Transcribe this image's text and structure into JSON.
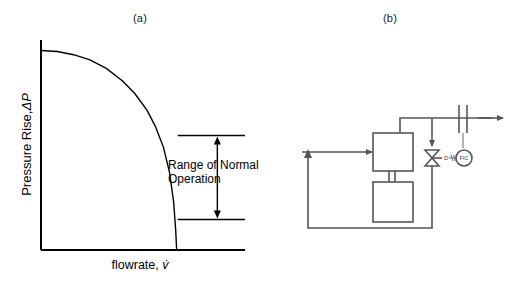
{
  "figure": {
    "panels": [
      {
        "id": "a",
        "label": "(a)"
      },
      {
        "id": "b",
        "label": "(b)"
      }
    ]
  },
  "chart_data": {
    "type": "line",
    "title": "(a)",
    "ylabel_prefix": "Pressure Rise,",
    "ylabel_symbol": "ΔP",
    "xlabel_prefix": "flowrate,",
    "xlabel_symbol": "v̇",
    "grid": false,
    "legend": false,
    "axis_ticks": false,
    "xlim": [
      0,
      1
    ],
    "ylim": [
      0,
      1
    ],
    "series": [
      {
        "name": "pump characteristic curve",
        "x": [
          0.0,
          0.08,
          0.16,
          0.24,
          0.32,
          0.4,
          0.46,
          0.52,
          0.56,
          0.6,
          0.63,
          0.65,
          0.66,
          0.665
        ],
        "y": [
          0.95,
          0.945,
          0.93,
          0.905,
          0.865,
          0.805,
          0.745,
          0.665,
          0.59,
          0.49,
          0.37,
          0.23,
          0.1,
          0.0
        ]
      }
    ],
    "annotations": [
      {
        "name": "range-of-normal-operation",
        "text_line_1": "Range of Normal",
        "text_line_2": "Operation",
        "marker": "double-headed-vertical-arrow",
        "upper_bound_y": 0.545,
        "lower_bound_y": 0.145,
        "x_start": 0.67,
        "x_end": 1.0
      }
    ]
  },
  "diagram": {
    "title": "(b)",
    "type": "piping-and-instrumentation",
    "components": [
      {
        "name": "suction-inlet-line",
        "kind": "process-line",
        "arrow": true
      },
      {
        "name": "pump-body",
        "kind": "block"
      },
      {
        "name": "pump-motor",
        "kind": "block"
      },
      {
        "name": "pump-shaft-coupling",
        "kind": "double-line"
      },
      {
        "name": "discharge-line",
        "kind": "process-line"
      },
      {
        "name": "orifice-flow-meter",
        "kind": "orifice-plate"
      },
      {
        "name": "product-outlet-line",
        "kind": "process-line",
        "arrow": true
      },
      {
        "name": "recycle-branch-line",
        "kind": "process-line",
        "arrow": true
      },
      {
        "name": "recycle-return-line",
        "kind": "process-line",
        "arrow": true
      },
      {
        "name": "control-valve",
        "kind": "globe-control-valve",
        "label": "D"
      },
      {
        "name": "flow-indicating-controller",
        "kind": "instrument-bubble",
        "label": "FIC"
      },
      {
        "name": "pneumatic-signal-line",
        "kind": "signal-line"
      },
      {
        "name": "sensing-line",
        "kind": "capillary-line"
      }
    ],
    "labels": {
      "valve_tag": "D",
      "controller_tag": "FIC"
    }
  },
  "colors": {
    "ink": "#000000",
    "pid_line": "#555555",
    "pid_signal": "#777777",
    "background": "#ffffff"
  }
}
